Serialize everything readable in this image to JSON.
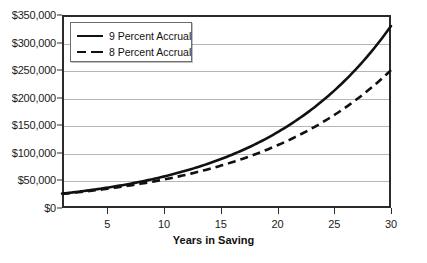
{
  "chart_data": {
    "type": "line",
    "title": "",
    "xlabel": "Years in Saving",
    "ylabel": "",
    "xlim": [
      1,
      30
    ],
    "ylim": [
      0,
      350000
    ],
    "grid": true,
    "legend_position": "top-left",
    "x_ticks": [
      5,
      10,
      15,
      20,
      25,
      30
    ],
    "x_tick_labels": [
      "5",
      "10",
      "15",
      "20",
      "25",
      "30"
    ],
    "y_ticks": [
      0,
      50000,
      100000,
      150000,
      200000,
      250000,
      300000,
      350000
    ],
    "y_tick_labels": [
      "$0",
      "$50,000",
      "$100,000",
      "$150,000",
      "$200,000",
      "$250,000",
      "$300,000",
      "$350,000"
    ],
    "x": [
      1,
      2,
      3,
      4,
      5,
      6,
      7,
      8,
      9,
      10,
      11,
      12,
      13,
      14,
      15,
      16,
      17,
      18,
      19,
      20,
      21,
      22,
      23,
      24,
      25,
      26,
      27,
      28,
      29,
      30
    ],
    "series": [
      {
        "name": "9 Percent Accrual",
        "style": "solid",
        "color": "#111111",
        "values": [
          26000,
          29500,
          33300,
          37500,
          42000,
          46900,
          52300,
          58100,
          64500,
          71400,
          79000,
          87200,
          96200,
          106000,
          116700,
          128400,
          141100,
          155000,
          170200,
          186700,
          204800,
          224500,
          246000,
          269500,
          295000,
          322800,
          353000,
          386000,
          422000,
          330000
        ]
      },
      {
        "name": "8 Percent Accrual",
        "style": "dashed",
        "color": "#111111",
        "values": [
          25500,
          28600,
          32000,
          35600,
          39500,
          43700,
          48200,
          53000,
          58200,
          63800,
          69800,
          76200,
          83100,
          90500,
          98400,
          106900,
          116000,
          125700,
          136100,
          147200,
          159100,
          171800,
          185400,
          199900,
          215400,
          231900,
          249500,
          268300,
          288400,
          250000
        ]
      }
    ],
    "series_endpoints": {
      "9 Percent Accrual": 330000,
      "8 Percent Accrual": 250000
    },
    "series_startpoints": {
      "9 Percent Accrual": 26000,
      "8 Percent Accrual": 25500
    }
  },
  "legend": {
    "items": [
      {
        "label": "9 Percent Accrual",
        "style": "solid"
      },
      {
        "label": "8 Percent Accrual",
        "style": "dashed"
      }
    ]
  },
  "axis": {
    "x_title": "Years in Saving"
  },
  "colors": {
    "line": "#111111",
    "grid": "#b6b6b6",
    "frame": "#2b2b2b",
    "background": "#ffffff"
  }
}
